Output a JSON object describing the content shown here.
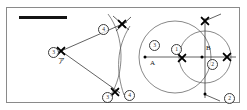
{
  "figure": {
    "frame": {
      "x": 6,
      "y": 7,
      "width": 234,
      "height": 96,
      "border_color": "#8a8a8a"
    },
    "redaction_bar": {
      "x": 19,
      "y": 16,
      "width": 48,
      "height": 3,
      "color": "#141414"
    },
    "colors": {
      "ink": "#2a2a2a",
      "construction_arc": "#555555",
      "ray": "#3a3a3a",
      "mark": "#000000",
      "background": "#ffffff"
    },
    "labels": [
      {
        "id": "label-3-vertex",
        "text": "3",
        "style": "circled",
        "x": 48,
        "y": 47
      },
      {
        "id": "label-a-kana",
        "text": "ア",
        "style": "kana",
        "x": 58,
        "y": 58
      },
      {
        "id": "label-4-top",
        "text": "4",
        "style": "circled",
        "x": 98,
        "y": 24
      },
      {
        "id": "label-3-bottom",
        "text": "3",
        "style": "circled",
        "x": 102,
        "y": 92
      },
      {
        "id": "label-4-bottom",
        "text": "4",
        "style": "circled",
        "x": 124,
        "y": 90
      },
      {
        "id": "label-3-circle",
        "text": "3",
        "style": "circled",
        "x": 149,
        "y": 40
      },
      {
        "id": "label-point-a",
        "text": "A",
        "style": "plain",
        "x": 150,
        "y": 60
      },
      {
        "id": "label-1-mid",
        "text": "1",
        "style": "circled",
        "x": 171,
        "y": 44
      },
      {
        "id": "label-point-b",
        "text": "B",
        "style": "plain",
        "x": 206,
        "y": 45
      },
      {
        "id": "label-2-right",
        "text": "2",
        "style": "circled",
        "x": 207,
        "y": 59
      },
      {
        "id": "label-2-bottom",
        "text": "2",
        "style": "circled",
        "x": 224,
        "y": 93
      }
    ],
    "points": [
      {
        "id": "point-vertex-a",
        "name": "vertex-a",
        "x": 61,
        "y": 51,
        "marker": "x"
      },
      {
        "id": "point-arc-top",
        "name": "arc-intersection-top",
        "x": 122,
        "y": 24,
        "marker": "x"
      },
      {
        "id": "point-arc-bottom",
        "name": "arc-intersection-bottom",
        "x": 115,
        "y": 92,
        "marker": "x"
      },
      {
        "id": "point-A",
        "name": "circle-center-a",
        "x": 145,
        "y": 57,
        "marker": "dot"
      },
      {
        "id": "point-mid-x",
        "name": "circle-intersection-mid",
        "x": 182,
        "y": 58,
        "marker": "x"
      },
      {
        "id": "point-B",
        "name": "circle-center-b",
        "x": 202,
        "y": 57,
        "marker": "dot"
      },
      {
        "id": "point-right-x",
        "name": "circle-intersection-right",
        "x": 227,
        "y": 57,
        "marker": "x"
      },
      {
        "id": "point-top-cross",
        "name": "circle-intersection-top",
        "x": 205,
        "y": 21,
        "marker": "x"
      },
      {
        "id": "point-bottom-cross",
        "name": "circle-intersection-bottom",
        "x": 205,
        "y": 94,
        "marker": "dot"
      }
    ],
    "circles": [
      {
        "id": "circle-a",
        "name": "circle-centered-a",
        "cx": 175,
        "cy": 57,
        "r": 36
      },
      {
        "id": "circle-b",
        "name": "circle-centered-b",
        "cx": 205,
        "cy": 57,
        "r": 26
      }
    ],
    "lines": [
      {
        "id": "line-horizontal",
        "name": "horizontal-axis-line",
        "x1": 144,
        "y1": 57,
        "x2": 236,
        "y2": 57
      },
      {
        "id": "line-vertical",
        "name": "vertical-axis-line",
        "x1": 205,
        "y1": 18,
        "x2": 205,
        "y2": 98
      },
      {
        "id": "ray-upper",
        "name": "ray-upper",
        "x1": 61,
        "y1": 51,
        "x2": 127,
        "y2": 22
      },
      {
        "id": "ray-lower",
        "name": "ray-lower",
        "x1": 61,
        "y1": 51,
        "x2": 120,
        "y2": 93
      },
      {
        "id": "tick-top-right",
        "name": "tick-mark-top-right",
        "x1": 207,
        "y1": 20,
        "x2": 221,
        "y2": 14
      },
      {
        "id": "tick-bottom-right",
        "name": "tick-mark-bottom-right",
        "x1": 206,
        "y1": 95,
        "x2": 220,
        "y2": 101
      },
      {
        "id": "tick-top-left",
        "name": "tick-mark-top-left",
        "x1": 113,
        "y1": 16,
        "x2": 129,
        "y2": 30
      },
      {
        "id": "tick-top-left-2",
        "name": "tick-mark-top-left-2",
        "x1": 131,
        "y1": 17,
        "x2": 116,
        "y2": 31
      }
    ],
    "arcs": [
      {
        "id": "arc-left-long",
        "name": "construction-arc-long",
        "d": "M 108 14 C 125 36 125 74 110 96"
      },
      {
        "id": "arc-left-short",
        "name": "construction-arc-short",
        "d": "M 130 26 C 116 48 116 72 124 95"
      }
    ]
  }
}
